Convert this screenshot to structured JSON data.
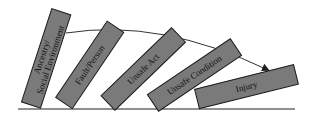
{
  "diagram": {
    "title": "",
    "dominoes": [
      {
        "line1": "Ancestry/",
        "line2": "Social Environment"
      },
      {
        "line1": "Fault/Person"
      },
      {
        "line1": "Unsafe Act"
      },
      {
        "line1": "Unsafe Condition"
      },
      {
        "line1": "Injury"
      }
    ],
    "colors": {
      "domino_fill": "#7a7a7a",
      "outline": "#1a1a1a",
      "background": "#ffffff"
    }
  }
}
